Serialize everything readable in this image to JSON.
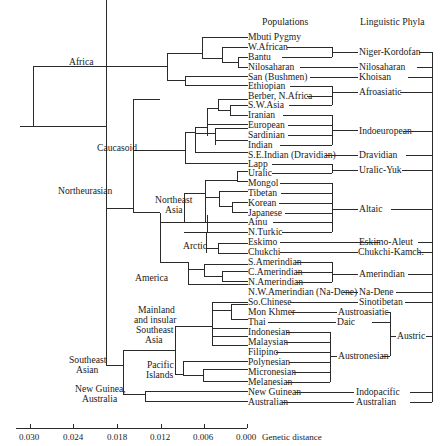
{
  "headers": {
    "populations": "Populations",
    "phyla": "Linguistic Phyla"
  },
  "axis": {
    "label": "Genetic distance",
    "ticks": [
      "0.030",
      "0.024",
      "0.018",
      "0.012",
      "0.006",
      "0.000"
    ],
    "tick_values": [
      0.03,
      0.024,
      0.018,
      0.012,
      0.006,
      0.0
    ]
  },
  "clade_labels": [
    {
      "text": "Africa"
    },
    {
      "text": "Caucasoid"
    },
    {
      "text": "Northeurasian"
    },
    {
      "text": "Northeast"
    },
    {
      "text": "Asia"
    },
    {
      "text": "Arctic"
    },
    {
      "text": "America"
    },
    {
      "text": "Mainland"
    },
    {
      "text": "and insular"
    },
    {
      "text": "Southeast"
    },
    {
      "text": "Asia"
    },
    {
      "text": "Pacific"
    },
    {
      "text": "Islands"
    },
    {
      "text": "Southeast"
    },
    {
      "text": "Asian"
    },
    {
      "text": "New Guinea,"
    },
    {
      "text": "Australia"
    }
  ],
  "populations": [
    "Mbuti Pygmy",
    "W.African",
    "Bantu",
    "Nilosaharan",
    "San (Bushmen)",
    "Ethiopian",
    "Berber, N.Africa",
    "S.W.Asia",
    "Iranian",
    "European",
    "Sardinian",
    "Indian",
    "S.E.Indian (Dravidian)",
    "Lapp",
    "Uralic",
    "Mongol",
    "Tibetan",
    "Korean",
    "Japanese",
    "Ainu",
    "N.Turkic",
    "Eskimo",
    "Chukchi",
    "S.Amerindian",
    "C.Amerindian",
    "N.Amerindian",
    "N.W.Amerindian (Na-Dene)",
    "So.Chinese",
    "Mon Khmer",
    "Thai",
    "Indonesian",
    "Malaysian",
    "Filipino",
    "Polynesian",
    "Micronesian",
    "Melanesian",
    "New Guinean",
    "Australian"
  ],
  "phyla": [
    "Niger-Kordofan",
    "Nilosaharan",
    "Khoisan",
    "Afroasiatic",
    "Indoeuropean",
    "Dravidian",
    "Uralic-Yuk",
    "Altaic",
    "Eskimo-Aleut",
    "Chukchi-Kamch.",
    "Amerindian",
    "Na-Dene",
    "Sinotibetan",
    "Austroasiatic",
    "Daic",
    "Austronesian",
    "Austric",
    "Indopacific",
    "Australian"
  ]
}
